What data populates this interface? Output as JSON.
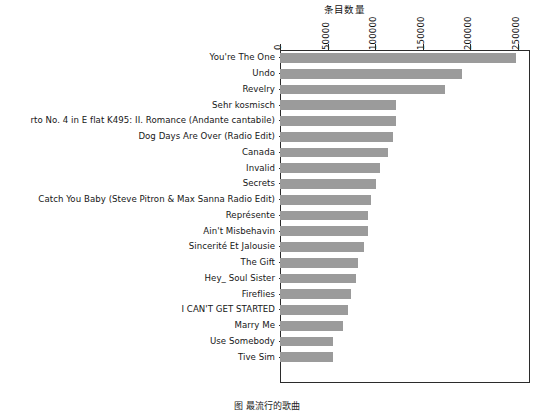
{
  "chart_data": {
    "type": "bar",
    "orientation": "horizontal",
    "title": "",
    "xlabel": "条目数量",
    "ylabel": "",
    "xlim": [
      0,
      262500
    ],
    "xticks": [
      0,
      50000,
      100000,
      150000,
      200000,
      250000
    ],
    "xtick_labels": [
      "0",
      "50000",
      "100000",
      "150000",
      "200000",
      "250000"
    ],
    "grid": false,
    "legend": null,
    "bar_color": "#9b9b9b",
    "axis_color": "#2b2b2b",
    "categories": [
      "You're The One",
      "Undo",
      "Revelry",
      "Sehr kosmisch",
      "rto No. 4 in E flat K495: II. Romance (Andante cantabile)",
      "Dog Days Are Over (Radio Edit)",
      "Canada",
      "Invalid",
      "Secrets",
      "Catch You Baby (Steve Pitron & Max Sanna Radio Edit)",
      "Représente",
      "Ain't Misbehavin",
      "Sincerité Et Jalousie",
      "The Gift",
      "Hey_ Soul Sister",
      "Fireflies",
      "I CAN'T GET STARTED",
      "Marry Me",
      "Use Somebody",
      "Tive Sim"
    ],
    "values": [
      248000,
      191000,
      173000,
      122000,
      122000,
      119000,
      113000,
      105000,
      101000,
      96000,
      92000,
      92000,
      88000,
      82000,
      80000,
      75000,
      71000,
      66000,
      56000,
      56000
    ]
  },
  "caption": "图  最流行的歌曲"
}
